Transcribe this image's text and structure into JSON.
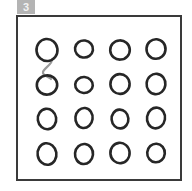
{
  "panel": {
    "index_label": "3",
    "badge_color": "#b4b4b4",
    "badge_text_color": "#f2f2f2"
  },
  "frame": {
    "border_color": "#3a3a3a",
    "background_color": "#ffffff",
    "x": 16,
    "y": 15,
    "width": 166,
    "height": 166
  },
  "grid": {
    "rows": 4,
    "cols": 4,
    "dot_color": "#262626",
    "link_color": "#9a9a9a",
    "dots": [
      {
        "id": "dot-r1-c1",
        "row": 1,
        "col": 1,
        "cx": 47,
        "cy": 50,
        "rx": 10.5,
        "ry": 11.0,
        "rot": -6
      },
      {
        "id": "dot-r1-c2",
        "row": 1,
        "col": 2,
        "cx": 84,
        "cy": 49,
        "rx": 9.0,
        "ry": 8.5,
        "rot": 8
      },
      {
        "id": "dot-r1-c3",
        "row": 1,
        "col": 3,
        "cx": 120,
        "cy": 50,
        "rx": 9.8,
        "ry": 9.6,
        "rot": -4
      },
      {
        "id": "dot-r1-c4",
        "row": 1,
        "col": 4,
        "cx": 156,
        "cy": 49,
        "rx": 9.5,
        "ry": 9.8,
        "rot": 5
      },
      {
        "id": "dot-r2-c1",
        "row": 2,
        "col": 1,
        "cx": 47,
        "cy": 85,
        "rx": 10.2,
        "ry": 9.6,
        "rot": -7
      },
      {
        "id": "dot-r2-c2",
        "row": 2,
        "col": 2,
        "cx": 84,
        "cy": 85,
        "rx": 8.8,
        "ry": 8.0,
        "rot": 4
      },
      {
        "id": "dot-r2-c3",
        "row": 2,
        "col": 3,
        "cx": 120,
        "cy": 84,
        "rx": 9.6,
        "ry": 9.9,
        "rot": -3
      },
      {
        "id": "dot-r2-c4",
        "row": 2,
        "col": 4,
        "cx": 156,
        "cy": 84,
        "rx": 9.4,
        "ry": 10.2,
        "rot": 6
      },
      {
        "id": "dot-r3-c1",
        "row": 3,
        "col": 1,
        "cx": 47,
        "cy": 119,
        "rx": 9.2,
        "ry": 10.2,
        "rot": -8
      },
      {
        "id": "dot-r3-c2",
        "row": 3,
        "col": 2,
        "cx": 84,
        "cy": 118,
        "rx": 8.6,
        "ry": 10.0,
        "rot": 7
      },
      {
        "id": "dot-r3-c3",
        "row": 3,
        "col": 3,
        "cx": 120,
        "cy": 119,
        "rx": 8.4,
        "ry": 9.4,
        "rot": -5
      },
      {
        "id": "dot-r3-c4",
        "row": 3,
        "col": 4,
        "cx": 156,
        "cy": 118,
        "rx": 9.0,
        "ry": 10.4,
        "rot": 9
      },
      {
        "id": "dot-r4-c1",
        "row": 4,
        "col": 1,
        "cx": 47,
        "cy": 154,
        "rx": 9.4,
        "ry": 10.8,
        "rot": -9
      },
      {
        "id": "dot-r4-c2",
        "row": 4,
        "col": 2,
        "cx": 84,
        "cy": 154,
        "rx": 9.0,
        "ry": 10.0,
        "rot": 6
      },
      {
        "id": "dot-r4-c3",
        "row": 4,
        "col": 3,
        "cx": 120,
        "cy": 153,
        "rx": 9.6,
        "ry": 10.2,
        "rot": -6
      },
      {
        "id": "dot-r4-c4",
        "row": 4,
        "col": 4,
        "cx": 156,
        "cy": 153,
        "rx": 8.8,
        "ry": 9.2,
        "rot": 4
      }
    ],
    "links": [
      {
        "id": "link-r1c1-r2c1",
        "from": "dot-r1-c1",
        "to": "dot-r2-c1",
        "path": "M 52 59 C 53 64, 44 68, 43 72 C 42 76, 50 77, 51 79"
      }
    ]
  }
}
